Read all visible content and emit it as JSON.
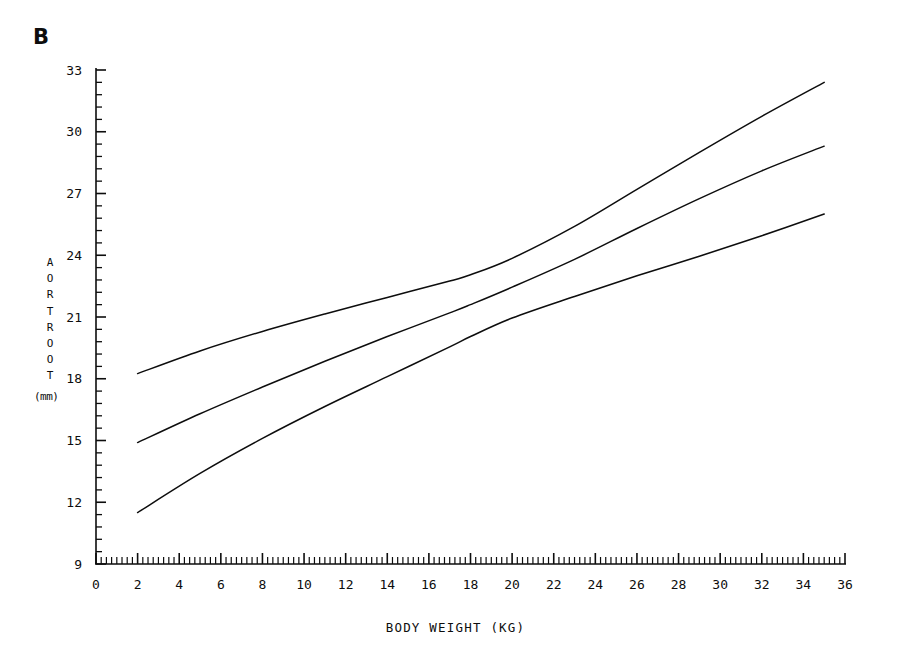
{
  "panel": {
    "label": "B"
  },
  "chart_data": {
    "type": "line",
    "title": "B",
    "xlabel": "BODY WEIGHT (KG)",
    "ylabel": "AORT ROOT (mm)",
    "ylabel_stacked": [
      "A",
      "O",
      "R",
      "T",
      "R",
      "O",
      "O",
      "T"
    ],
    "yunit": "(mm)",
    "xlim": [
      0,
      36
    ],
    "ylim": [
      9,
      33
    ],
    "xticks": [
      0,
      2,
      4,
      6,
      8,
      10,
      12,
      14,
      16,
      18,
      20,
      22,
      24,
      26,
      28,
      30,
      32,
      34,
      36
    ],
    "xtick_labels": [
      "0",
      "2",
      "4",
      "6",
      "8",
      "10",
      "12",
      "14",
      "16",
      "18",
      "20",
      "22",
      "24",
      "26",
      "28",
      "30",
      "32",
      "34",
      "36"
    ],
    "yticks": [
      9,
      12,
      15,
      18,
      21,
      24,
      27,
      30,
      33
    ],
    "ytick_labels": [
      "9",
      "12",
      "15",
      "18",
      "21",
      "24",
      "27",
      "30",
      "33"
    ],
    "x_minor_step": 0.25,
    "y_minor_step": 0.6,
    "grid": false,
    "legend": "none",
    "line_color": "#0d0d0d",
    "x": [
      2,
      5,
      8,
      11,
      14,
      17,
      18,
      20,
      23,
      26,
      29,
      32,
      35
    ],
    "series": [
      {
        "name": "upper-limit",
        "values": [
          18.25,
          19.35,
          20.3,
          21.15,
          21.95,
          22.75,
          23.05,
          23.85,
          25.4,
          27.2,
          29.0,
          30.75,
          32.4
        ]
      },
      {
        "name": "mean",
        "values": [
          14.9,
          16.3,
          17.6,
          18.85,
          20.05,
          21.2,
          21.6,
          22.45,
          23.8,
          25.3,
          26.75,
          28.1,
          29.3
        ]
      },
      {
        "name": "lower-limit",
        "values": [
          11.5,
          13.4,
          15.1,
          16.65,
          18.1,
          19.55,
          20.05,
          20.95,
          22.0,
          23.0,
          23.95,
          24.95,
          26.0
        ]
      }
    ]
  }
}
